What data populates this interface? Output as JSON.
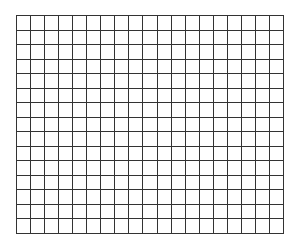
{
  "grid": {
    "columns": 19,
    "rows": 15,
    "line_color": "#333333",
    "background": "#ffffff",
    "line_width": 1,
    "width": 268,
    "height": 219
  }
}
